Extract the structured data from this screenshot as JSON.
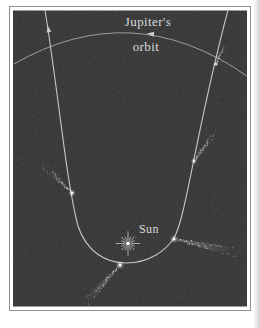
{
  "figure": {
    "labels": {
      "jupiter_line1": "Jupiter's",
      "jupiter_line2": "orbit",
      "sun": "Sun"
    },
    "colors": {
      "page_bg": "#ffffff",
      "frame_border": "#8f8f8f",
      "panel_bg": "#3b3b3b",
      "orbit_line": "#b5b5b5",
      "trajectory_line": "#cccccc",
      "label_text": "#dadada",
      "comet_white": "#ffffff",
      "sun_color": "#ededed"
    },
    "icons": [
      {
        "name": "sun-icon",
        "glyph": "engraved starburst with radiating rays"
      },
      {
        "name": "comet-icon",
        "glyph": "bright head with speckled tail pointing away from sun"
      },
      {
        "name": "arrowhead-icon",
        "glyph": "small solid triangle showing direction of motion"
      }
    ],
    "sun": {
      "x": 128,
      "y": 243.5,
      "ray_count": 16,
      "long_ray": 9,
      "mid_ray": 6,
      "short_ray": 4,
      "core_radius": 1.9
    },
    "comets": [
      {
        "id": "outbound-upper-right",
        "head": {
          "x": 216,
          "y": 64
        },
        "tail_angle_deg": -70,
        "tail_len": 15,
        "size": 1.1
      },
      {
        "id": "mid-right",
        "head": {
          "x": 194,
          "y": 161
        },
        "tail_angle_deg": -53,
        "tail_len": 30,
        "size": 1.3
      },
      {
        "id": "mid-left",
        "head": {
          "x": 72,
          "y": 193
        },
        "tail_angle_deg": -136,
        "tail_len": 33,
        "size": 1.5
      },
      {
        "id": "perihelion",
        "head": {
          "x": 120,
          "y": 265
        },
        "tail_angle_deg": 132,
        "tail_len": 46,
        "size": 1.7
      },
      {
        "id": "lower-right",
        "head": {
          "x": 174,
          "y": 239
        },
        "tail_angle_deg": 12,
        "tail_len": 56,
        "size": 1.6
      }
    ],
    "arrows": [
      {
        "name": "jupiter-orbit-direction-arrowhead",
        "x": 147,
        "y": 33.5,
        "angle_deg": -174,
        "scale": 1.0
      },
      {
        "name": "comet-outbound-direction-arrowhead",
        "x": 48,
        "y": 26,
        "angle_deg": -99,
        "scale": 0.9
      }
    ]
  }
}
